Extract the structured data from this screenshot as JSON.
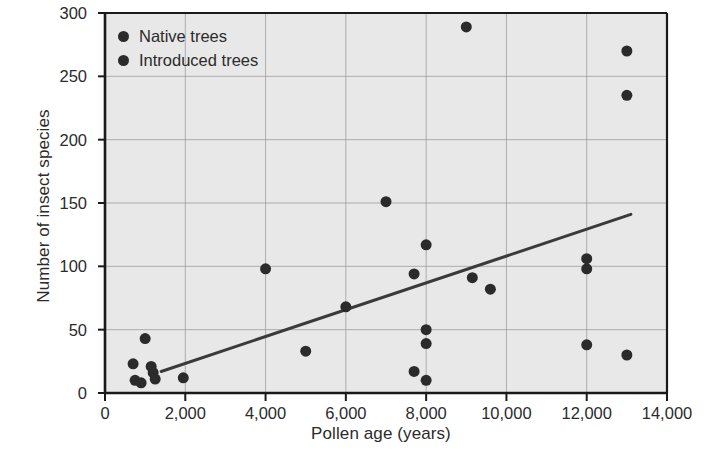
{
  "chart_data": {
    "type": "scatter",
    "title": "",
    "xlabel": "Pollen age (years)",
    "ylabel": "Number of insect species",
    "xlim": [
      0,
      14000
    ],
    "ylim": [
      0,
      300
    ],
    "xticks": [
      0,
      2000,
      4000,
      6000,
      8000,
      10000,
      12000,
      14000
    ],
    "xticklabels": [
      "0",
      "2,000",
      "4,000",
      "6,000",
      "8,000",
      "10,000",
      "12,000",
      "14,000"
    ],
    "yticks": [
      0,
      50,
      100,
      150,
      200,
      250,
      300
    ],
    "yticklabels": [
      "0",
      "50",
      "100",
      "150",
      "200",
      "250",
      "300"
    ],
    "grid": true,
    "grid_color": "#9a9a9a",
    "plot_background": "#e8e8e8",
    "marker_color": "#2b2b2b",
    "marker_size": 11,
    "legend": {
      "position": "top-left-inside",
      "entries": [
        {
          "label": "Native trees",
          "color": "#2b2b2b",
          "marker": "circle"
        },
        {
          "label": "Introduced trees",
          "color": "#2b2b2b",
          "marker": "circle"
        }
      ]
    },
    "series": [
      {
        "name": "Native trees",
        "marker": "circle",
        "color": "#2b2b2b",
        "points": [
          {
            "x": 700,
            "y": 23
          },
          {
            "x": 750,
            "y": 10
          },
          {
            "x": 900,
            "y": 8
          },
          {
            "x": 1000,
            "y": 43
          },
          {
            "x": 1150,
            "y": 21
          },
          {
            "x": 1200,
            "y": 16
          },
          {
            "x": 1250,
            "y": 11
          },
          {
            "x": 1950,
            "y": 12
          },
          {
            "x": 4000,
            "y": 98
          },
          {
            "x": 5000,
            "y": 33
          },
          {
            "x": 6000,
            "y": 68
          },
          {
            "x": 7000,
            "y": 151
          },
          {
            "x": 7700,
            "y": 94
          },
          {
            "x": 7700,
            "y": 17
          },
          {
            "x": 8000,
            "y": 117
          },
          {
            "x": 8000,
            "y": 50
          },
          {
            "x": 8000,
            "y": 39
          },
          {
            "x": 8000,
            "y": 10
          },
          {
            "x": 9000,
            "y": 289
          },
          {
            "x": 9150,
            "y": 91
          },
          {
            "x": 9600,
            "y": 82
          },
          {
            "x": 12000,
            "y": 106
          },
          {
            "x": 12000,
            "y": 98
          },
          {
            "x": 12000,
            "y": 38
          },
          {
            "x": 13000,
            "y": 270
          },
          {
            "x": 13000,
            "y": 235
          },
          {
            "x": 13000,
            "y": 30
          }
        ]
      }
    ],
    "trendline": {
      "color": "#3a3a3a",
      "width": 3,
      "x_start": 1400,
      "y_start": 17,
      "x_end": 13100,
      "y_end": 141
    }
  }
}
